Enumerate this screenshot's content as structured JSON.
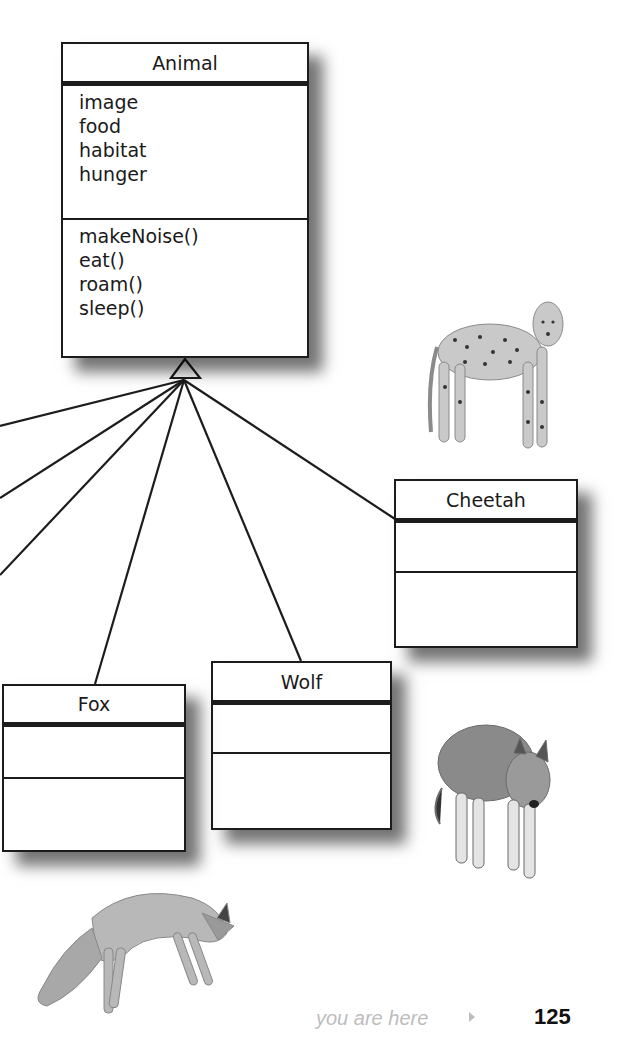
{
  "diagram": {
    "type": "UML class inheritance",
    "superclass": {
      "name": "Animal",
      "attributes": [
        "image",
        "food",
        "habitat",
        "hunger"
      ],
      "methods": [
        "makeNoise()",
        "eat()",
        "roam()",
        "sleep()"
      ]
    },
    "subclasses": [
      {
        "name": "Cheetah",
        "attributes": [],
        "methods": []
      },
      {
        "name": "Wolf",
        "attributes": [],
        "methods": []
      },
      {
        "name": "Fox",
        "attributes": [],
        "methods": []
      }
    ],
    "photos": [
      "cheetah",
      "wolf",
      "fox"
    ]
  },
  "footer": {
    "you_are_here": "you are here",
    "page_number": "125"
  }
}
